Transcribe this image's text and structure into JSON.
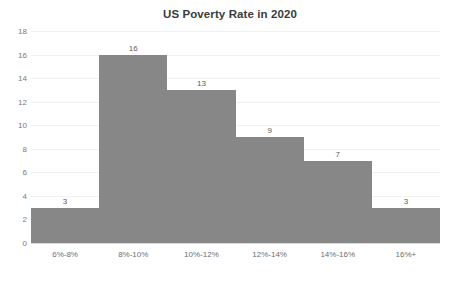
{
  "chart_data": {
    "type": "bar",
    "title": "US Poverty Rate in 2020",
    "xlabel": "",
    "ylabel": "",
    "categories": [
      "6%-8%",
      "8%-10%",
      "10%-12%",
      "12%-14%",
      "14%-16%",
      "16%+"
    ],
    "values": [
      3,
      16,
      13,
      9,
      7,
      3
    ],
    "data_labels": [
      "3",
      "16",
      "13",
      "9",
      "7",
      "3"
    ],
    "ylim": [
      0,
      18
    ],
    "yticks": [
      0,
      2,
      4,
      6,
      8,
      10,
      12,
      14,
      16,
      18
    ],
    "ytick_labels": [
      "0",
      "2",
      "4",
      "6",
      "8",
      "10",
      "12",
      "14",
      "16",
      "18"
    ],
    "grid": true,
    "legend": false,
    "legend_position": "none",
    "bar_color": "#878787",
    "gridline_color": "#f1f1f1",
    "axis_color": "#d9d9d9",
    "title_color": "#3b3b3b",
    "tick_label_color": "#7a7a7a",
    "background_color": "#ffffff"
  }
}
